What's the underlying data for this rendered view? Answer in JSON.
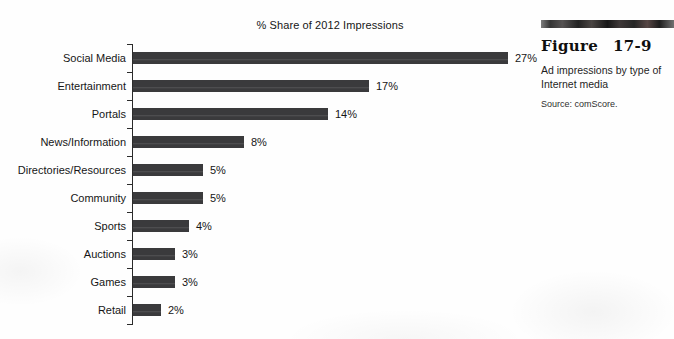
{
  "chart_data": {
    "type": "bar",
    "orientation": "horizontal",
    "title": "% Share of 2012 Impressions",
    "categories": [
      "Social Media",
      "Entertainment",
      "Portals",
      "News/Information",
      "Directories/Resources",
      "Community",
      "Sports",
      "Auctions",
      "Games",
      "Retail"
    ],
    "values": [
      27,
      17,
      14,
      8,
      5,
      5,
      4,
      3,
      3,
      2
    ],
    "value_labels": [
      "27%",
      "17%",
      "14%",
      "8%",
      "5%",
      "5%",
      "4%",
      "3%",
      "3%",
      "2%"
    ],
    "unit": "%",
    "xlim": [
      0,
      28
    ],
    "grid": false,
    "legend": false,
    "bar_color": "#3a3a3c",
    "axis_color": "#2b2b2b"
  },
  "figure": {
    "label": "Figure",
    "number": "17-9",
    "description": "Ad impressions by type of Internet media",
    "source": "Source: comScore."
  },
  "colors": {
    "text": "#1c1c1c",
    "background": "#fefefe",
    "band_dark": "#242424"
  }
}
